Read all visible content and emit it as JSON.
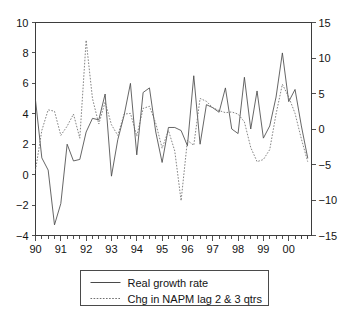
{
  "chart_data": {
    "type": "line",
    "title": "",
    "subtitle": "",
    "xlabel": "",
    "ylabel": "",
    "y2label": "",
    "grid": false,
    "legend_position": "bottom",
    "xlim": [
      1990.0,
      2000.9
    ],
    "ylim": [
      -4,
      10
    ],
    "y2lim": [
      -15,
      15
    ],
    "x_tick_labels": [
      "90",
      "91",
      "92",
      "93",
      "94",
      "95",
      "96",
      "97",
      "98",
      "99",
      "00"
    ],
    "x_tick_values": [
      1990,
      1991,
      1992,
      1993,
      1994,
      1995,
      1996,
      1997,
      1998,
      1999,
      2000
    ],
    "x_minor_ticks_per_year": 4,
    "y_left_tick_labels": [
      "10",
      "8",
      "6",
      "4",
      "2",
      "0",
      "-2",
      "-4"
    ],
    "y_left_tick_values": [
      10,
      8,
      6,
      4,
      2,
      0,
      -2,
      -4
    ],
    "y_right_tick_labels": [
      "15",
      "10",
      "5",
      "0",
      "-5",
      "-10",
      "-15"
    ],
    "y_right_tick_values": [
      15,
      10,
      5,
      0,
      -5,
      -10,
      -15
    ],
    "series": [
      {
        "name": "Real growth rate",
        "style": "solid",
        "axis": "left",
        "color": "#4a4a4a",
        "x": [
          1990.0,
          1990.25,
          1990.5,
          1990.75,
          1991.0,
          1991.25,
          1991.5,
          1991.75,
          1992.0,
          1992.25,
          1992.5,
          1992.75,
          1993.0,
          1993.25,
          1993.5,
          1993.75,
          1994.0,
          1994.25,
          1994.5,
          1994.75,
          1995.0,
          1995.25,
          1995.5,
          1995.75,
          1996.0,
          1996.25,
          1996.5,
          1996.75,
          1997.0,
          1997.25,
          1997.5,
          1997.75,
          1998.0,
          1998.25,
          1998.5,
          1998.75,
          1999.0,
          1999.25,
          1999.5,
          1999.75,
          2000.0,
          2000.25,
          2000.5,
          2000.75
        ],
        "y": [
          4.9,
          1.1,
          0.3,
          -3.3,
          -1.9,
          2.0,
          0.9,
          1.0,
          2.8,
          3.7,
          3.6,
          5.3,
          -0.1,
          2.3,
          3.9,
          6.0,
          1.3,
          5.4,
          5.7,
          2.8,
          0.8,
          3.1,
          3.1,
          2.9,
          1.9,
          6.5,
          2.0,
          4.6,
          4.4,
          4.1,
          5.7,
          3.0,
          2.7,
          6.4,
          3.0,
          5.5,
          2.4,
          3.2,
          5.1,
          8.0,
          4.8,
          5.6,
          3.2,
          1.1
        ]
      },
      {
        "name": "Chg in NAPM lag 2 & 3 qtrs",
        "style": "dotted",
        "axis": "right",
        "color": "#6e6e6e",
        "x": [
          1990.0,
          1990.25,
          1990.5,
          1990.75,
          1991.0,
          1991.25,
          1991.5,
          1991.75,
          1992.0,
          1992.25,
          1992.5,
          1992.75,
          1993.0,
          1993.25,
          1993.5,
          1993.75,
          1994.0,
          1994.25,
          1994.5,
          1994.75,
          1995.0,
          1995.25,
          1995.5,
          1995.75,
          1996.0,
          1996.25,
          1996.5,
          1996.75,
          1997.0,
          1997.25,
          1997.5,
          1997.75,
          1998.0,
          1998.25,
          1998.5,
          1998.75,
          1999.0,
          1999.25,
          1999.5,
          1999.75,
          2000.0,
          2000.25,
          2000.5,
          2000.75
        ],
        "y": [
          -5.8,
          -0.2,
          2.7,
          2.5,
          -0.9,
          0.4,
          2.1,
          -1.3,
          12.5,
          4.3,
          0.7,
          3.8,
          0.6,
          -0.9,
          2.1,
          2.2,
          -1.0,
          2.9,
          3.2,
          0.8,
          -2.7,
          -0.2,
          -3.1,
          -10.1,
          -1.6,
          -2.3,
          4.3,
          3.9,
          3.0,
          2.6,
          2.3,
          2.4,
          2.1,
          1.0,
          -2.6,
          -4.6,
          -4.3,
          -2.9,
          2.1,
          6.3,
          4.5,
          2.2,
          -1.4,
          -4.6
        ]
      }
    ]
  },
  "legend": {
    "items": [
      {
        "label": "Real growth rate",
        "style": "solid"
      },
      {
        "label": "Chg in NAPM lag 2 & 3 qtrs",
        "style": "dotted"
      }
    ]
  }
}
